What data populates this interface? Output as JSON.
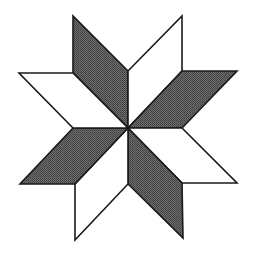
{
  "figure": {
    "title": "Eight-pointed star (LeMoyne star) of rhombi",
    "center": [
      128,
      128
    ],
    "colors": {
      "dark": "#5a5a5a",
      "light": "#ffffff",
      "stroke": "#1a1a1a",
      "background": "#ffffff"
    },
    "rhombi": [
      {
        "name": "top-left",
        "fill": "dark",
        "points": "128,128 73,73 73,16 128,71"
      },
      {
        "name": "top-right",
        "fill": "light",
        "points": "128,128 128,71 182,16 182,71"
      },
      {
        "name": "right-upper",
        "fill": "dark",
        "points": "128,128 182,71 237,71 182,128"
      },
      {
        "name": "right-lower",
        "fill": "light",
        "points": "128,128 182,128 237,183 182,183"
      },
      {
        "name": "bottom-right",
        "fill": "dark",
        "points": "128,128 182,183 183,238 128,184"
      },
      {
        "name": "bottom-left",
        "fill": "light",
        "points": "128,128 128,184 75,240 75,184"
      },
      {
        "name": "left-lower",
        "fill": "dark",
        "points": "128,128 75,184 20,184 73,128"
      },
      {
        "name": "left-upper",
        "fill": "light",
        "points": "128,128 73,128 19,73 73,73"
      }
    ]
  }
}
